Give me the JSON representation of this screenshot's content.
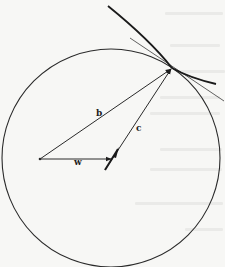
{
  "figure": {
    "background_color": "#f7f7f5",
    "ink_color": "#1e1e1e",
    "circle": {
      "cx": 111,
      "cy": 158,
      "r": 109
    },
    "origin": {
      "x": 40,
      "y": 159
    },
    "tangent_point": {
      "x": 172,
      "y": 68
    },
    "vectors": [
      {
        "id": "b",
        "label": "b",
        "from": [
          40,
          159
        ],
        "to": [
          171,
          69
        ],
        "label_pos": [
          96,
          116
        ]
      },
      {
        "id": "c",
        "label": "c",
        "from": [
          105,
          170
        ],
        "to": [
          171,
          69
        ],
        "label_pos": [
          136,
          131
        ]
      },
      {
        "id": "w",
        "label": "w",
        "from": [
          40,
          159
        ],
        "to": [
          111,
          159
        ],
        "label_pos": [
          74,
          165
        ]
      }
    ],
    "curves": {
      "thick_curve": {
        "path": "M108,6 Q150,40 172,68 Q190,78 216,84"
      },
      "tangent_line": {
        "from": [
          130,
          38
        ],
        "to": [
          224,
          101
        ]
      }
    },
    "bleed_through_lines": [
      {
        "x": 165,
        "y": 12,
        "w": 58
      },
      {
        "x": 170,
        "y": 44,
        "w": 50
      },
      {
        "x": 180,
        "y": 70,
        "w": 45
      },
      {
        "x": 160,
        "y": 96,
        "w": 60
      },
      {
        "x": 150,
        "y": 112,
        "w": 70
      },
      {
        "x": 160,
        "y": 148,
        "w": 62
      },
      {
        "x": 150,
        "y": 168,
        "w": 72
      },
      {
        "x": 135,
        "y": 202,
        "w": 88
      },
      {
        "x": 185,
        "y": 228,
        "w": 38
      }
    ]
  }
}
